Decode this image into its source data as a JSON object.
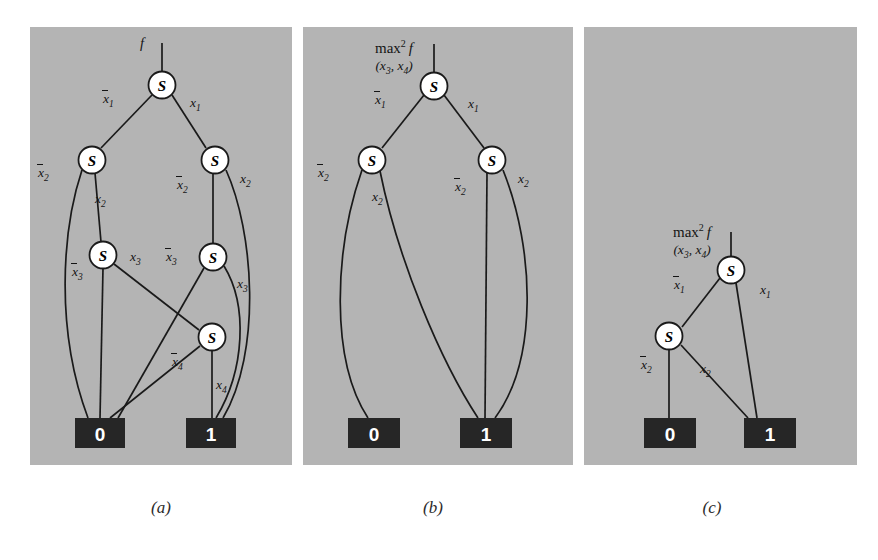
{
  "figure": {
    "background_color": "#ffffff",
    "panel_color": "#b4b4b4",
    "terminal_color": "#262626",
    "node_color": "#ffffff",
    "edge_color": "#1a1a1a",
    "node_symbol": "S"
  },
  "panels": [
    {
      "id": "a",
      "caption": "(a)",
      "root_label": "f",
      "root_label_kind": "function",
      "terminals": [
        {
          "value": "0"
        },
        {
          "value": "1"
        }
      ],
      "nodes": [
        {
          "id": "a-n1",
          "symbol": "S",
          "level": 1,
          "var": "x1"
        },
        {
          "id": "a-n2",
          "symbol": "S",
          "level": 2,
          "var": "x2"
        },
        {
          "id": "a-n3",
          "symbol": "S",
          "level": 2,
          "var": "x2"
        },
        {
          "id": "a-n4",
          "symbol": "S",
          "level": 3,
          "var": "x3"
        },
        {
          "id": "a-n5",
          "symbol": "S",
          "level": 3,
          "var": "x3"
        },
        {
          "id": "a-n6",
          "symbol": "S",
          "level": 4,
          "var": "x4"
        }
      ],
      "edge_labels": [
        {
          "text": "x1",
          "negated": true
        },
        {
          "text": "x1",
          "negated": false
        },
        {
          "text": "x2",
          "negated": true
        },
        {
          "text": "x2",
          "negated": false
        },
        {
          "text": "x2",
          "negated": true
        },
        {
          "text": "x2",
          "negated": false
        },
        {
          "text": "x3",
          "negated": true
        },
        {
          "text": "x3",
          "negated": false
        },
        {
          "text": "x3",
          "negated": true
        },
        {
          "text": "x3",
          "negated": false
        },
        {
          "text": "x4",
          "negated": true
        },
        {
          "text": "x4",
          "negated": false
        }
      ]
    },
    {
      "id": "b",
      "caption": "(b)",
      "root_label": "max",
      "root_label_kind": "max",
      "root_label_sup": "2",
      "root_label_fn": "f",
      "root_label_args": "(x3, x4)",
      "terminals": [
        {
          "value": "0"
        },
        {
          "value": "1"
        }
      ],
      "nodes": [
        {
          "id": "b-n1",
          "symbol": "S",
          "level": 1,
          "var": "x1"
        },
        {
          "id": "b-n2",
          "symbol": "S",
          "level": 2,
          "var": "x2"
        },
        {
          "id": "b-n3",
          "symbol": "S",
          "level": 2,
          "var": "x2"
        }
      ],
      "edge_labels": [
        {
          "text": "x1",
          "negated": true
        },
        {
          "text": "x1",
          "negated": false
        },
        {
          "text": "x2",
          "negated": true
        },
        {
          "text": "x2",
          "negated": false
        },
        {
          "text": "x2",
          "negated": true
        },
        {
          "text": "x2",
          "negated": false
        }
      ]
    },
    {
      "id": "c",
      "caption": "(c)",
      "root_label": "max",
      "root_label_kind": "max",
      "root_label_sup": "2",
      "root_label_fn": "f",
      "root_label_args": "(x3, x4)",
      "terminals": [
        {
          "value": "0"
        },
        {
          "value": "1"
        }
      ],
      "nodes": [
        {
          "id": "c-n1",
          "symbol": "S",
          "level": 1,
          "var": "x1"
        },
        {
          "id": "c-n2",
          "symbol": "S",
          "level": 2,
          "var": "x2"
        }
      ],
      "edge_labels": [
        {
          "text": "x1",
          "negated": true
        },
        {
          "text": "x1",
          "negated": false
        },
        {
          "text": "x2",
          "negated": true
        },
        {
          "text": "x2",
          "negated": false
        }
      ]
    }
  ],
  "labels": {
    "x1": "x",
    "x1sub": "1",
    "x2": "x",
    "x2sub": "2",
    "x3": "x",
    "x3sub": "3",
    "x4": "x",
    "x4sub": "4"
  }
}
